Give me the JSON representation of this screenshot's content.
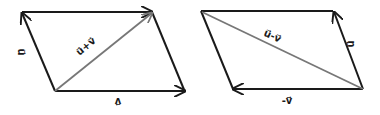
{
  "diagram": {
    "colors": {
      "edge": "#1a1a1a",
      "diagonal": "#777777",
      "background": "#ffffff"
    },
    "left": {
      "name": "vector-sum-parallelogram",
      "labels": {
        "u": "u⃗",
        "v": "v⃗",
        "diagonal": "u⃗+v⃗"
      }
    },
    "right": {
      "name": "vector-difference-parallelogram",
      "labels": {
        "u": "u⃗",
        "v": "-v⃗",
        "diagonal": "u⃗-v⃗"
      }
    }
  }
}
